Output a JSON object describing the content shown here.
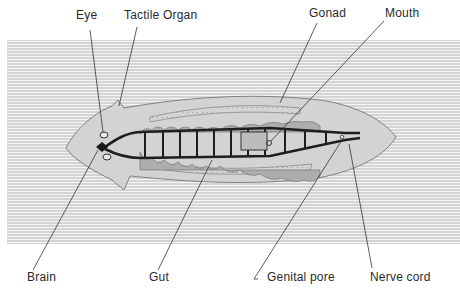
{
  "diagram": {
    "colors": {
      "background": "#ffffff",
      "hatch_line": "#b8b8b8",
      "body_fill": "#d2d2d2",
      "body_outline": "#7a7a7a",
      "nerve": "#1e1e1e",
      "gut": "#a9a9a9",
      "gonad": "#bdbdbd",
      "label_text": "#2a2a2a"
    },
    "labels": {
      "eye": "Eye",
      "tactile_organ": "Tactile Organ",
      "gonad": "Gonad",
      "mouth": "Mouth",
      "brain": "Brain",
      "gut": "Gut",
      "genital_pore": "Genital pore",
      "nerve_cord": "Nerve cord"
    }
  }
}
